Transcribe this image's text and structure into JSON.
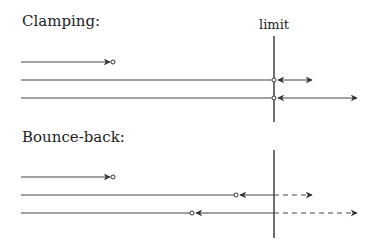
{
  "diagram": {
    "clamping": {
      "title": "Clamping:",
      "limit_label": "limit",
      "limit_x": 274,
      "limit_line": {
        "y1": 36,
        "y2": 122
      },
      "rows": [
        {
          "y": 62,
          "start_x": 21,
          "end_x": 113,
          "type": "below-limit"
        },
        {
          "y": 80,
          "start_x": 21,
          "end_x": 274,
          "overshoot_x": 312,
          "type": "clamped"
        },
        {
          "y": 98,
          "start_x": 21,
          "end_x": 274,
          "overshoot_x": 357,
          "type": "clamped"
        }
      ]
    },
    "bounce_back": {
      "title": "Bounce-back:",
      "limit_x": 274,
      "limit_line": {
        "y1": 150,
        "y2": 238
      },
      "rows": [
        {
          "y": 177,
          "start_x": 21,
          "end_x": 113,
          "type": "below-limit"
        },
        {
          "y": 195,
          "start_x": 21,
          "end_x": 236,
          "overshoot_x": 312,
          "type": "bounced"
        },
        {
          "y": 213,
          "start_x": 21,
          "end_x": 192,
          "overshoot_x": 357,
          "type": "bounced"
        }
      ]
    },
    "colors": {
      "ink": "#333333",
      "background": "#ffffff"
    }
  }
}
